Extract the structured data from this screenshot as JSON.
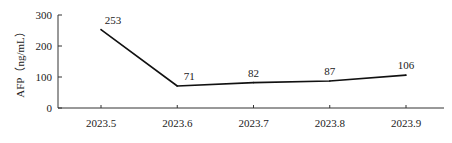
{
  "chart_data": {
    "type": "line",
    "title": "",
    "xlabel": "",
    "ylabel": "AFP（ng/mL）",
    "categories": [
      "2023.5",
      "2023.6",
      "2023.7",
      "2023.8",
      "2023.9"
    ],
    "series": [
      {
        "name": "AFP",
        "values": [
          253,
          71,
          82,
          87,
          106
        ],
        "color": "#111111"
      }
    ],
    "data_labels": [
      "253",
      "71",
      "82",
      "87",
      "106"
    ],
    "yticks": [
      0,
      100,
      200,
      300
    ],
    "ytick_labels": [
      "0",
      "100",
      "200",
      "300"
    ],
    "ylim": [
      0,
      300
    ],
    "grid": false,
    "legend": "none"
  }
}
